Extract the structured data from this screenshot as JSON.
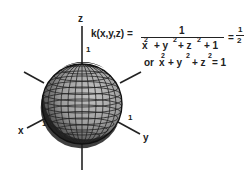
{
  "diagram": {
    "type": "3d-level-surface",
    "shape": "sphere",
    "colors": {
      "sphere_fill": "#9a9a9a",
      "sphere_shadow": "#2a2a2a",
      "grid": "#222222",
      "axis": "#222222"
    },
    "axes": {
      "z": {
        "label": "z",
        "tick_label": "1"
      },
      "x": {
        "label": "x",
        "tick_label": "1"
      },
      "y": {
        "label": "y",
        "tick_label": "1"
      }
    },
    "formula": {
      "lhs": "k(x,y,z) =",
      "numerator": "1",
      "denominator": {
        "x": "x",
        "x_exp": "2",
        "plus1": "+ y",
        "y_exp": "2",
        "plus2": "+ z",
        "z_exp": "2",
        "plus3": "+ 1"
      },
      "result_eq": "=",
      "result_num": "1",
      "result_den": "2"
    },
    "equivalent": {
      "prefix": "or",
      "x": "x",
      "x_exp": "2",
      "plus_y": "+ y",
      "y_exp": "2",
      "plus_z": "+ z",
      "z_exp": "2",
      "equals": "= 1"
    }
  }
}
